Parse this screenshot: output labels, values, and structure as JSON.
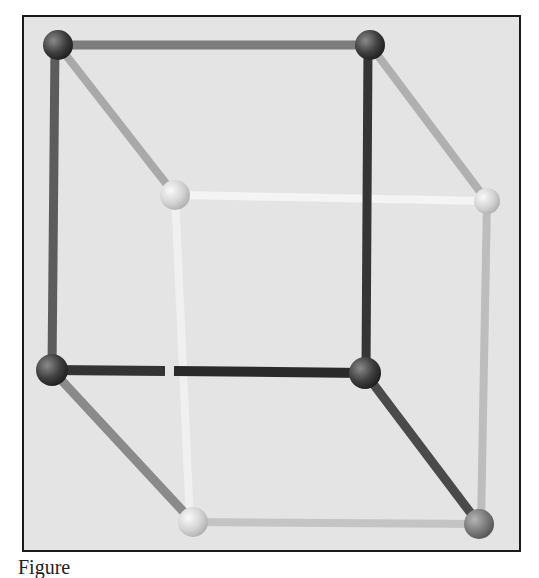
{
  "figure": {
    "background_color": "#e4e4e4",
    "border_color": "#1a1a1a",
    "caption": "Figure"
  },
  "vertices": [
    {
      "id": "top-back-left",
      "x": 58,
      "y": 45,
      "r": 15,
      "shade": "#4a4a4a"
    },
    {
      "id": "top-back-right",
      "x": 370,
      "y": 45,
      "r": 15,
      "shade": "#4a4a4a"
    },
    {
      "id": "mid-back-left",
      "x": 175,
      "y": 195,
      "r": 15,
      "shade": "#d8d8d8"
    },
    {
      "id": "mid-back-right",
      "x": 487,
      "y": 201,
      "r": 13,
      "shade": "#cfcfcf"
    },
    {
      "id": "bottom-front-left",
      "x": 52,
      "y": 370,
      "r": 16,
      "shade": "#3e3e3e"
    },
    {
      "id": "bottom-front-right",
      "x": 365,
      "y": 373,
      "r": 16,
      "shade": "#2a2a2a"
    },
    {
      "id": "bottom-back-left",
      "x": 193,
      "y": 522,
      "r": 15,
      "shade": "#c8c8c8"
    },
    {
      "id": "bottom-back-right",
      "x": 479,
      "y": 524,
      "r": 15,
      "shade": "#7a7a7a"
    }
  ],
  "edges": [
    {
      "from": "top-back-left",
      "to": "top-back-right",
      "color": "#7d7d7d"
    },
    {
      "from": "top-back-left",
      "to": "mid-back-left",
      "color": "#a9a9a9"
    },
    {
      "from": "top-back-right",
      "to": "mid-back-right",
      "color": "#a9a9a9"
    },
    {
      "from": "top-back-left",
      "to": "bottom-front-left",
      "color": "#5c5c5c"
    },
    {
      "from": "top-back-right",
      "to": "bottom-front-right",
      "color": "#404040"
    },
    {
      "from": "mid-back-left",
      "to": "mid-back-right",
      "color": "#f4f4f4"
    },
    {
      "from": "mid-back-left",
      "to": "bottom-back-left",
      "color": "#f0f0f0"
    },
    {
      "from": "mid-back-right",
      "to": "bottom-back-right",
      "color": "#bdbdbd"
    },
    {
      "from": "bottom-front-left",
      "to": "bottom-front-right",
      "color": "#2e2e2e"
    },
    {
      "from": "bottom-front-left",
      "to": "bottom-back-left",
      "color": "#8a8a8a"
    },
    {
      "from": "bottom-front-right",
      "to": "bottom-back-right",
      "color": "#4a4a4a"
    },
    {
      "from": "bottom-back-left",
      "to": "bottom-back-right",
      "color": "#c0c0c0"
    }
  ]
}
